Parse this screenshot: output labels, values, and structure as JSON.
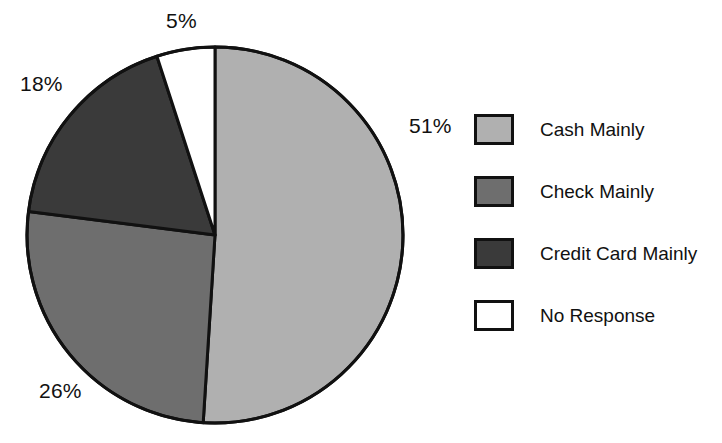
{
  "chart_data": {
    "type": "pie",
    "title": "",
    "subtitle": "",
    "xlabel": "",
    "ylabel": "",
    "grid": false,
    "legend_position": "right",
    "start_angle_deg": 0,
    "direction": "clockwise",
    "categories": [
      "Cash Mainly",
      "Check Mainly",
      "Credit Card Mainly",
      "No Response"
    ],
    "values": [
      51,
      26,
      18,
      5
    ],
    "value_unit": "%",
    "data_labels": [
      "51%",
      "26%",
      "18%",
      "5%"
    ],
    "colors": [
      "#b0b0b0",
      "#6e6e6e",
      "#3a3a3a",
      "#ffffff"
    ],
    "slice_border_color": "#111111",
    "slices": [
      {
        "label": "Cash Mainly",
        "value": 51,
        "display": "51%",
        "color": "#b0b0b0",
        "start_deg": 0,
        "end_deg": 183.6
      },
      {
        "label": "Check Mainly",
        "value": 26,
        "display": "26%",
        "color": "#6e6e6e",
        "start_deg": 183.6,
        "end_deg": 277.2
      },
      {
        "label": "Credit Card Mainly",
        "value": 18,
        "display": "18%",
        "color": "#3a3a3a",
        "start_deg": 277.2,
        "end_deg": 342.0
      },
      {
        "label": "No Response",
        "value": 5,
        "display": "5%",
        "color": "#ffffff",
        "start_deg": 342.0,
        "end_deg": 360.0
      }
    ]
  },
  "pie": {
    "callouts": {
      "top": "5%",
      "left": "18%",
      "right": "51%",
      "bottom": "26%"
    }
  },
  "legend": {
    "items": [
      {
        "label": "Cash Mainly",
        "color": "#b0b0b0"
      },
      {
        "label": "Check Mainly",
        "color": "#6e6e6e"
      },
      {
        "label": "Credit Card Mainly",
        "color": "#3a3a3a"
      },
      {
        "label": "No Response",
        "color": "#ffffff"
      }
    ]
  }
}
